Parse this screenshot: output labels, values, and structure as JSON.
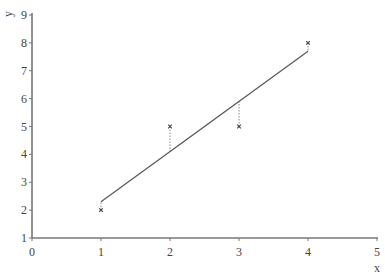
{
  "chart_data": {
    "type": "scatter",
    "title": "",
    "xlabel": "x",
    "ylabel": "y",
    "xlim": [
      0,
      5
    ],
    "ylim": [
      1,
      9
    ],
    "x_ticks": [
      "0",
      "1",
      "2",
      "3",
      "4",
      "5"
    ],
    "y_ticks": [
      "1",
      "2",
      "3",
      "4",
      "5",
      "6",
      "7",
      "8",
      "9"
    ],
    "grid": false,
    "legend": null,
    "series": [
      {
        "name": "observations",
        "marker": "x",
        "x": [
          1,
          2,
          3,
          4
        ],
        "y": [
          2,
          5,
          5,
          8
        ]
      },
      {
        "name": "regression line",
        "type": "line",
        "x": [
          1,
          4
        ],
        "y": [
          2.3,
          7.7
        ]
      }
    ],
    "residuals": [
      {
        "x": 1,
        "y_obs": 2,
        "y_fit": 2.3
      },
      {
        "x": 2,
        "y_obs": 5,
        "y_fit": 4.1
      },
      {
        "x": 3,
        "y_obs": 5,
        "y_fit": 5.9
      },
      {
        "x": 4,
        "y_obs": 8,
        "y_fit": 7.7
      }
    ],
    "annotations": [
      "dotted vertical residual lines from each point to fitted line"
    ]
  }
}
